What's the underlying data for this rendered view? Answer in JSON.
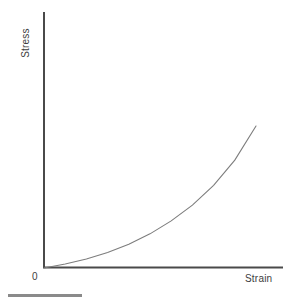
{
  "chart_data": {
    "type": "line",
    "title": "",
    "subtitle": "",
    "xlabel": "Strain",
    "ylabel": "Stress",
    "origin_label": "0",
    "grid": false,
    "legend": null,
    "annotations": [],
    "axis_color": "#4a4a4a",
    "curve_color": "#7d7d7d",
    "text_color": "#3d3d3d",
    "rule_color": "#8a8a8a",
    "xlim": [
      0,
      1
    ],
    "ylim": [
      0,
      1
    ],
    "series": [
      {
        "name": "stress-strain",
        "x": [
          0.0,
          0.1,
          0.2,
          0.3,
          0.4,
          0.5,
          0.6,
          0.7,
          0.8,
          0.9,
          1.0
        ],
        "y": [
          0.0,
          0.022,
          0.05,
          0.086,
          0.132,
          0.19,
          0.262,
          0.35,
          0.46,
          0.6,
          0.79
        ]
      }
    ]
  },
  "labels": {
    "y_axis": "Stress",
    "x_axis": "Strain",
    "origin": "0"
  }
}
